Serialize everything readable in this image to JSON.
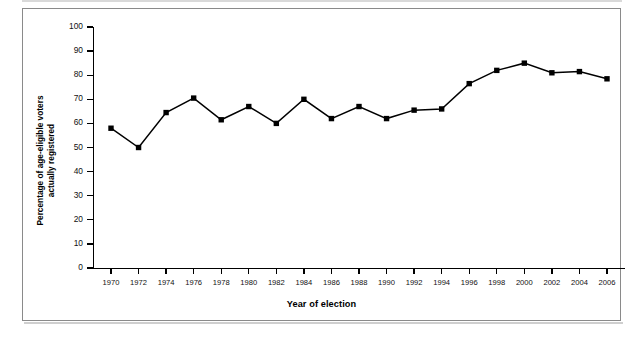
{
  "figure": {
    "frame_color": "#8a8a8a",
    "background": "#ffffff",
    "series_color": "#000000"
  },
  "chart_data": {
    "type": "line",
    "title": "",
    "xlabel": "Year of election",
    "ylabel": "Percentage of age-eligible voters actually registered",
    "ylabel_line1": "Percentage of age-eligible voters",
    "ylabel_line2": "actually registered",
    "xlim": [
      1969,
      2007
    ],
    "ylim": [
      0,
      100
    ],
    "y_ticks": [
      0,
      10,
      20,
      30,
      40,
      50,
      60,
      70,
      80,
      90,
      100
    ],
    "grid": false,
    "legend": null,
    "marker": "square",
    "categories": [
      "1970",
      "1972",
      "1974",
      "1976",
      "1978",
      "1980",
      "1982",
      "1984",
      "1986",
      "1988",
      "1990",
      "1992",
      "1994",
      "1996",
      "1998",
      "2000",
      "2002",
      "2004",
      "2006"
    ],
    "x": [
      1970,
      1972,
      1974,
      1976,
      1978,
      1980,
      1982,
      1984,
      1986,
      1988,
      1990,
      1992,
      1994,
      1996,
      1998,
      2000,
      2002,
      2004,
      2006
    ],
    "values": [
      58,
      50,
      64.5,
      70.5,
      61.5,
      67,
      60,
      70,
      62,
      67,
      62,
      65.5,
      66,
      76.5,
      82,
      85,
      81,
      81.5,
      78.5
    ],
    "series": [
      {
        "name": "Percentage of age-eligible voters actually registered",
        "values": [
          58,
          50,
          64.5,
          70.5,
          61.5,
          67,
          60,
          70,
          62,
          67,
          62,
          65.5,
          66,
          76.5,
          82,
          85,
          81,
          81.5,
          78.5
        ]
      }
    ]
  }
}
